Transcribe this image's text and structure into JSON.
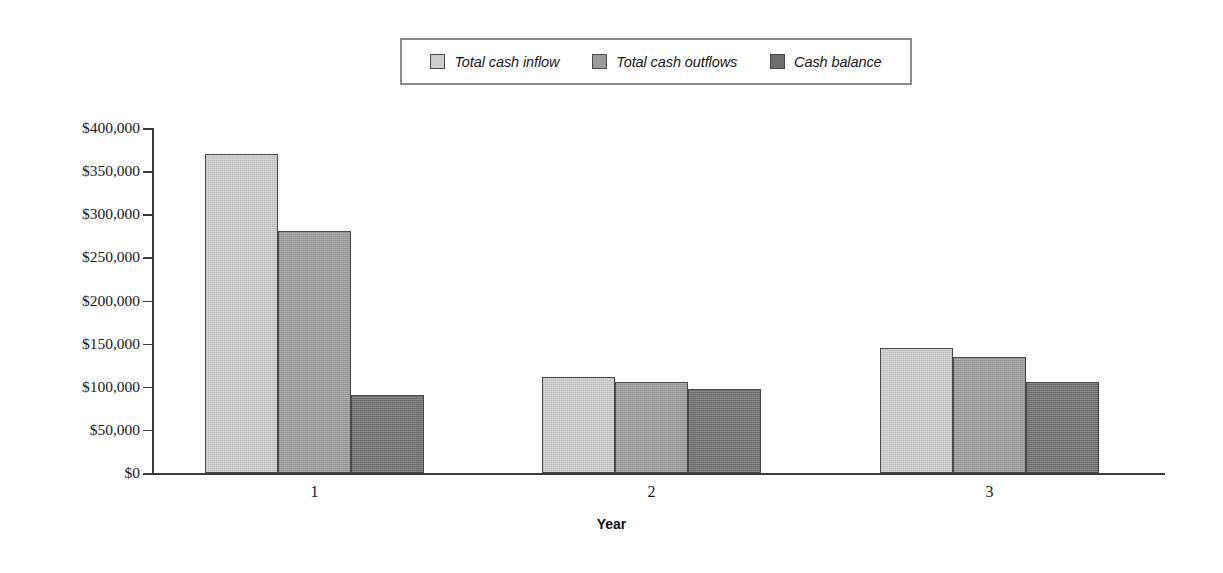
{
  "chart_data": {
    "type": "bar",
    "title": "",
    "subtitle": "",
    "xlabel": "Year",
    "ylabel": "",
    "categories": [
      "1",
      "2",
      "3"
    ],
    "series": [
      {
        "name": "Total cash inflow",
        "values": [
          370000,
          111000,
          145000
        ],
        "color": "#cccccc"
      },
      {
        "name": "Total cash outflows",
        "values": [
          281000,
          105000,
          135000
        ],
        "color": "#9a9a9a"
      },
      {
        "name": "Cash balance",
        "values": [
          90000,
          97000,
          106000
        ],
        "color": "#6e6e6e"
      }
    ],
    "ylim": [
      0,
      400000
    ],
    "ytick_step": 50000,
    "ytick_labels": [
      "$400,000",
      "$350,000",
      "$300,000",
      "$250,000",
      "$200,000",
      "$150,000",
      "$100,000",
      "$50,000",
      "$0"
    ],
    "ytick_values": [
      400000,
      350000,
      300000,
      250000,
      200000,
      150000,
      100000,
      50000,
      0
    ],
    "grid": false,
    "legend_position": "top",
    "value_prefix": "$",
    "orientation": "vertical",
    "grouping": "grouped"
  },
  "legend": {
    "entries": [
      {
        "label": "Total cash inflow",
        "color": "#cccccc"
      },
      {
        "label": "Total cash outflows",
        "color": "#9a9a9a"
      },
      {
        "label": "Cash balance",
        "color": "#6e6e6e"
      }
    ]
  },
  "axes": {
    "x_title": "Year",
    "x_categories": [
      "1",
      "2",
      "3"
    ],
    "y_labels": [
      "$400,000",
      "$350,000",
      "$300,000",
      "$250,000",
      "$200,000",
      "$150,000",
      "$100,000",
      "$50,000",
      "$0"
    ]
  },
  "colors": {
    "series_light": "#cccccc",
    "series_mid": "#9a9a9a",
    "series_dark": "#6e6e6e",
    "axis": "#3a3a3a",
    "border": "#4a4a4a",
    "text": "#1a1a1a",
    "background": "#ffffff"
  }
}
